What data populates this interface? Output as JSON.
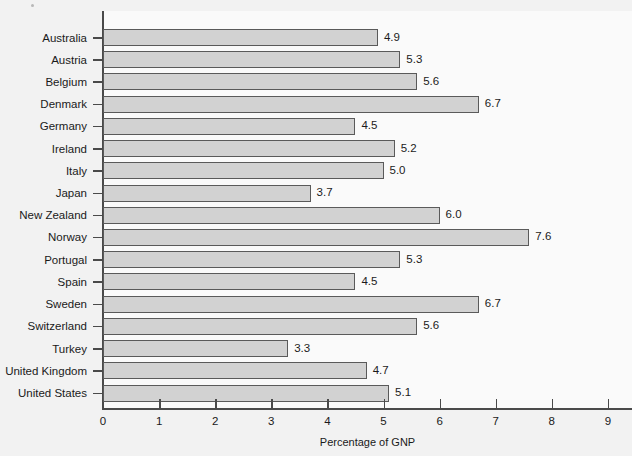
{
  "chart_data": {
    "type": "bar",
    "orientation": "horizontal",
    "title": "",
    "xlabel": "Percentage of GNP",
    "ylabel": "",
    "xlim": [
      0,
      9
    ],
    "xticks": [
      "0",
      "1",
      "2",
      "3",
      "4",
      "5",
      "6",
      "7",
      "8",
      "9"
    ],
    "grid": false,
    "legend": null,
    "categories": [
      "Australia",
      "Austria",
      "Belgium",
      "Denmark",
      "Germany",
      "Ireland",
      "Italy",
      "Japan",
      "New Zealand",
      "Norway",
      "Portugal",
      "Spain",
      "Sweden",
      "Switzerland",
      "Turkey",
      "United Kingdom",
      "United States"
    ],
    "values": [
      4.9,
      5.3,
      5.6,
      6.7,
      4.5,
      5.2,
      5.0,
      3.7,
      6.0,
      7.6,
      5.3,
      4.5,
      6.7,
      5.6,
      3.3,
      4.7,
      5.1
    ],
    "value_labels": [
      "4.9",
      "5.3",
      "5.6",
      "6.7",
      "4.5",
      "5.2",
      "5.0",
      "3.7",
      "6.0",
      "7.6",
      "5.3",
      "4.5",
      "6.7",
      "5.6",
      "3.3",
      "4.7",
      "5.1"
    ],
    "colors": {
      "bar_fill": "#d2d2d2",
      "bar_stroke": "#5a5a5a",
      "axis": "#4a4a4a",
      "text": "#1a1a1a",
      "page_background": "#f2f2f2",
      "plot_background": "#fafafa"
    }
  }
}
